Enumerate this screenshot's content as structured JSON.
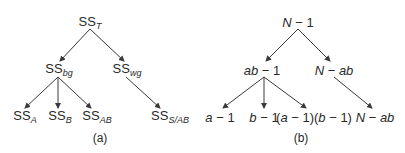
{
  "panels": [
    {
      "caption": "(a)",
      "root": {
        "base": "SS",
        "sub": "T"
      },
      "level1": [
        {
          "base": "SS",
          "sub": "bg"
        },
        {
          "base": "SS",
          "sub": "wg"
        }
      ],
      "leaves": [
        {
          "base": "SS",
          "sub": "A"
        },
        {
          "base": "SS",
          "sub": "B"
        },
        {
          "base": "SS",
          "sub": "AB"
        },
        {
          "base": "SS",
          "sub": "S/AB"
        }
      ]
    },
    {
      "caption": "(b)",
      "root": {
        "pre": "N",
        "post": " − 1"
      },
      "level1": [
        {
          "pre": "ab",
          "post": " − 1"
        },
        {
          "pre": "N",
          "post": " − ",
          "post2": "ab"
        }
      ],
      "leaves": [
        {
          "pre": "a",
          "post": " − 1"
        },
        {
          "pre": "b",
          "post": " − 1"
        },
        {
          "text": "(a − 1)(b − 1)",
          "p1": "(",
          "v1": "a",
          "p2": " − 1)(",
          "v2": "b",
          "p3": " − 1)"
        },
        {
          "pre": "N",
          "post": " − ",
          "post2": "ab"
        }
      ]
    }
  ],
  "colors": {
    "line": "#3a3a3a",
    "text": "#2a2a2a",
    "background": "#ffffff"
  }
}
